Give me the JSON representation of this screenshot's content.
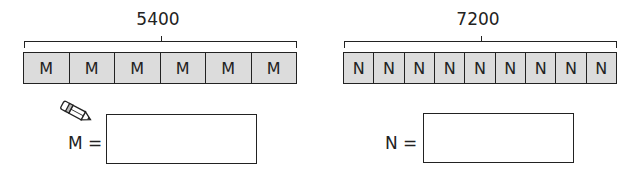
{
  "left": {
    "total": "5400",
    "unit_label": "M",
    "unit_count": 6,
    "units": [
      "M",
      "M",
      "M",
      "M",
      "M",
      "M"
    ],
    "answer_label": "M =",
    "answer_value": ""
  },
  "right": {
    "total": "7200",
    "unit_label": "N",
    "unit_count": 9,
    "units": [
      "N",
      "N",
      "N",
      "N",
      "N",
      "N",
      "N",
      "N",
      "N"
    ],
    "answer_label": "N =",
    "answer_value": ""
  },
  "icons": {
    "pencil": "pencil-icon"
  },
  "colors": {
    "cell_fill": "#dcdcdc",
    "stroke": "#222222"
  }
}
